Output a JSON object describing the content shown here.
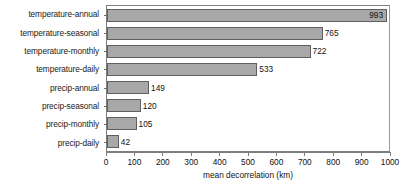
{
  "chart_data": {
    "type": "bar",
    "orientation": "horizontal",
    "title": "",
    "xlabel": "mean decorrelation (km)",
    "ylabel": "",
    "xlim": [
      0,
      1000
    ],
    "xticks": [
      0,
      100,
      200,
      300,
      400,
      500,
      600,
      700,
      800,
      900,
      1000
    ],
    "xtick_labels": [
      "0",
      "100",
      "200",
      "300",
      "400",
      "500",
      "600",
      "700",
      "800",
      "900",
      "1000"
    ],
    "grid": false,
    "legend": null,
    "categories": [
      "temperature-annual",
      "temperature-seasonal",
      "temperature-monthly",
      "temperature-daily",
      "precip-annual",
      "precip-seasonal",
      "precip-monthly",
      "precip-daily"
    ],
    "values": [
      993,
      765,
      722,
      533,
      149,
      120,
      105,
      42
    ],
    "value_labels": [
      "993",
      "765",
      "722",
      "533",
      "149",
      "120",
      "105",
      "42"
    ],
    "label_placement": [
      "inside",
      "outside",
      "outside",
      "outside",
      "outside",
      "outside",
      "outside",
      "outside"
    ],
    "colors": {
      "bar_fill": "#a8a8a8",
      "bar_border": "#5f5f5f",
      "axis": "#7d7d7d",
      "text": "#111111",
      "background": "#ffffff"
    }
  }
}
